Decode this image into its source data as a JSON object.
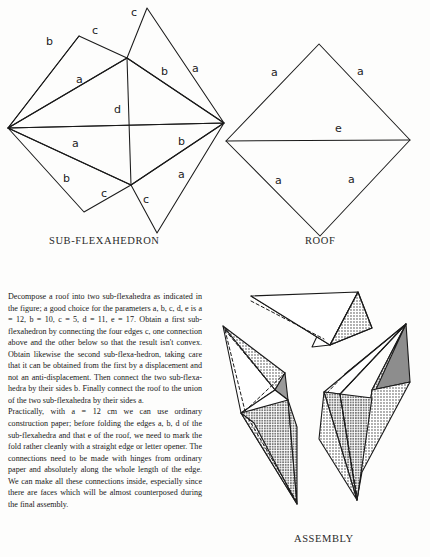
{
  "figure": {
    "subflexahedron": {
      "caption": "SUB-FLEXAHEDRON",
      "edge_labels": [
        {
          "id": "c-top",
          "text": "c",
          "x": 131,
          "y": 16
        },
        {
          "id": "c-upper-left",
          "text": "c",
          "x": 92,
          "y": 34
        },
        {
          "id": "b-upper-left",
          "text": "b",
          "x": 46,
          "y": 45
        },
        {
          "id": "a-upper-left",
          "text": "a",
          "x": 76,
          "y": 83
        },
        {
          "id": "a-upper-right",
          "text": "a",
          "x": 192,
          "y": 72
        },
        {
          "id": "b-upper-right",
          "text": "b",
          "x": 161,
          "y": 75
        },
        {
          "id": "d-center",
          "text": "d",
          "x": 119,
          "y": 113
        },
        {
          "id": "a-lower-left",
          "text": "a",
          "x": 72,
          "y": 147
        },
        {
          "id": "b-lower-left",
          "text": "b",
          "x": 63,
          "y": 182
        },
        {
          "id": "c-lower-left",
          "text": "c",
          "x": 101,
          "y": 197
        },
        {
          "id": "c-lower-center",
          "text": "c",
          "x": 143,
          "y": 203
        },
        {
          "id": "b-lower-right",
          "text": "b",
          "x": 178,
          "y": 145
        },
        {
          "id": "a-lower-right",
          "text": "a",
          "x": 178,
          "y": 178
        }
      ]
    },
    "roof": {
      "caption": "ROOF",
      "edge_labels": [
        {
          "id": "a-top-left",
          "text": "a",
          "x": 271,
          "y": 76
        },
        {
          "id": "a-top-right",
          "text": "a",
          "x": 357,
          "y": 75
        },
        {
          "id": "e-middle",
          "text": "e",
          "x": 335,
          "y": 130
        },
        {
          "id": "a-bottom-left",
          "text": "a",
          "x": 275,
          "y": 184
        },
        {
          "id": "a-bottom-right",
          "text": "a",
          "x": 348,
          "y": 183
        }
      ]
    },
    "assembly": {
      "caption": "ASSEMBLY"
    }
  },
  "body_text": {
    "paragraph_1": "Decompose a roof into two sub-flexahedra as indicated in the figure; a good choice for the parameters a, b, c, d, e is a = 12, b = 10, c = 5, d = 11, e = 17. Obtain a first sub-flexahedron by connecting the four edges c, one connection above and the other below so that the result isn't convex. Obtain likewise the second sub-flexa-hedron, taking care that it can be obtained from the first by a displacement and not an anti-displacement. Then connect the two sub-flexa-hedra by their sides b. Finally connect the roof to the union of the two sub-flexahedra by their sides a.",
    "paragraph_2": "Practically, with a = 12 cm we can use ordinary construction paper; before folding the edges a, b, d of the sub-flexahedra and that e of the roof, we need to mark the fold rather cleanly with a straight edge or letter opener. The connections need to be made with hinges from ordinary paper and absolutely along the whole length of the edge. We can make all these connections inside, especially since there are faces which will be almost counterposed during the final assembly."
  },
  "colors": {
    "ink": "#1a1a1a",
    "page": "#fdfdfc",
    "shade_light": "#c9c9c9",
    "shade_dark": "#8f8f8f",
    "shade_mid": "#b4b4b4"
  }
}
